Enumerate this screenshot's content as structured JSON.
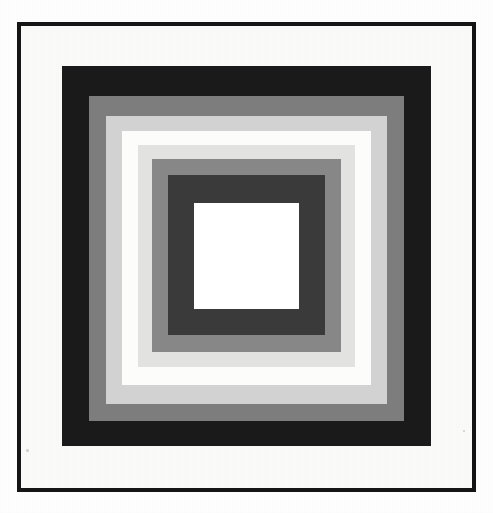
{
  "artwork": {
    "title": "Nested Concentric Squares",
    "style": "Homage to the Square",
    "medium": "grayscale geometric print",
    "canvas": {
      "width": 493,
      "height": 513,
      "background": "#ffffff"
    },
    "frame": {
      "name": "outer black rule frame",
      "color": "#151515",
      "border_width": 4,
      "x": 17,
      "y": 22,
      "width": 459,
      "height": 470
    },
    "mat": {
      "name": "white mat field",
      "color": "#fbfbf9",
      "x": 21,
      "y": 26,
      "width": 451,
      "height": 462
    },
    "bands": [
      {
        "index": 0,
        "label": "band-1-black",
        "tone": "black",
        "color": "#1a1a1a",
        "x": 62,
        "y": 66,
        "width": 369,
        "height": 380
      },
      {
        "index": 1,
        "label": "band-2-medium-gray",
        "tone": "medium gray",
        "color": "#7d7d7d",
        "x": 89,
        "y": 96,
        "width": 315,
        "height": 325
      },
      {
        "index": 2,
        "label": "band-3-light-gray",
        "tone": "light gray",
        "color": "#d2d2d2",
        "x": 106,
        "y": 116,
        "width": 281,
        "height": 288
      },
      {
        "index": 3,
        "label": "band-4-white",
        "tone": "white",
        "color": "#fcfcfa",
        "x": 122,
        "y": 131,
        "width": 249,
        "height": 254
      },
      {
        "index": 4,
        "label": "band-5-pale-gray",
        "tone": "pale gray",
        "color": "#e2e2e0",
        "x": 138,
        "y": 145,
        "width": 217,
        "height": 222
      },
      {
        "index": 5,
        "label": "band-6-medium-gray",
        "tone": "medium gray",
        "color": "#878787",
        "x": 152,
        "y": 159,
        "width": 189,
        "height": 193
      },
      {
        "index": 6,
        "label": "band-7-dark-gray",
        "tone": "dark gray",
        "color": "#3a3a3a",
        "x": 168,
        "y": 175,
        "width": 157,
        "height": 160
      },
      {
        "index": 7,
        "label": "band-8-center-white",
        "tone": "white",
        "color": "#ffffff",
        "x": 194,
        "y": 203,
        "width": 105,
        "height": 106
      }
    ],
    "speckles": [
      {
        "x": 26,
        "y": 449,
        "size": 3
      },
      {
        "x": 463,
        "y": 430,
        "size": 2
      }
    ]
  }
}
